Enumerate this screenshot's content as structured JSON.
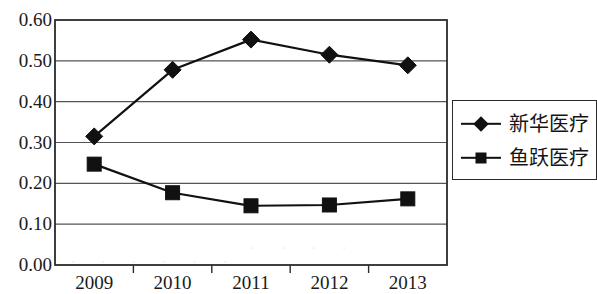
{
  "chart_data": {
    "type": "line",
    "title": "",
    "xlabel": "",
    "ylabel": "",
    "categories": [
      "2009",
      "2010",
      "2011",
      "2012",
      "2013"
    ],
    "series": [
      {
        "name": "新华医疗",
        "marker": "diamond",
        "color": "#111111",
        "values": [
          0.315,
          0.478,
          0.552,
          0.515,
          0.489
        ]
      },
      {
        "name": "鱼跃医疗",
        "marker": "square",
        "color": "#111111",
        "values": [
          0.247,
          0.177,
          0.145,
          0.147,
          0.162
        ]
      }
    ],
    "ylim": [
      0.0,
      0.6
    ],
    "y_ticks": [
      "0.00",
      "0.10",
      "0.20",
      "0.30",
      "0.40",
      "0.50",
      "0.60"
    ],
    "y_tick_values": [
      0.0,
      0.1,
      0.2,
      0.3,
      0.4,
      0.5,
      0.6
    ],
    "grid": "horizontal",
    "legend_position": "right"
  },
  "legend": {
    "entries": [
      {
        "label": "新华医疗",
        "marker": "diamond"
      },
      {
        "label": "鱼跃医疗",
        "marker": "square"
      }
    ]
  },
  "colors": {
    "series": "#111111",
    "axis": "#2b2b2b",
    "grid": "#555555",
    "background": "#ffffff"
  }
}
